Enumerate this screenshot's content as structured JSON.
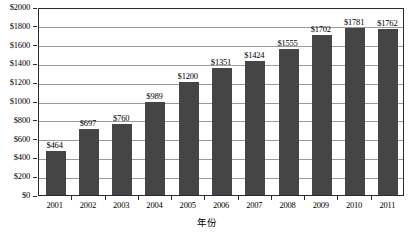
{
  "chart_data": {
    "type": "bar",
    "title": "",
    "subtitle": "",
    "xlabel": "年份",
    "ylabel": "",
    "categories": [
      "2001",
      "2002",
      "2003",
      "2004",
      "2005",
      "2006",
      "2007",
      "2008",
      "2009",
      "2010",
      "2011"
    ],
    "values": [
      464,
      697,
      760,
      989,
      1200,
      1351,
      1424,
      1555,
      1702,
      1781,
      1762
    ],
    "data_labels": [
      "$464",
      "$697",
      "$760",
      "$989",
      "$1200",
      "$1351",
      "$1424",
      "$1555",
      "$1702",
      "$1781",
      "$1762"
    ],
    "ylim": [
      0,
      2000
    ],
    "ytick_values": [
      0,
      200,
      400,
      600,
      800,
      1000,
      1200,
      1400,
      1600,
      1800,
      2000
    ],
    "ytick_labels": [
      "$0",
      "$200",
      "$400",
      "$600",
      "$800",
      "$1000",
      "$1200",
      "$1400",
      "$1600",
      "$1800",
      "$2000"
    ],
    "grid": true,
    "legend": null,
    "legend_position": "none",
    "value_prefix": "$",
    "series_name": ""
  },
  "style": {
    "bar_color": "#454545",
    "gridline_color": "#9a9a9a",
    "axis_color": "#2b2b2b",
    "text_color": "#000000",
    "background_color": "#ffffff"
  }
}
